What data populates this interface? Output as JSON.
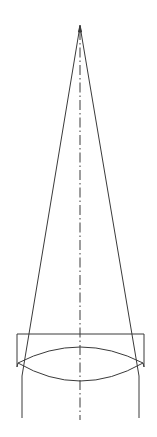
{
  "diagram": {
    "title": "",
    "type": "optical-lens-focus",
    "colors": {
      "line": "#3a3a3a",
      "background": "#ffffff"
    },
    "apex": {
      "x": 80,
      "y": 26
    },
    "axis": {
      "x": 80,
      "y1": 26,
      "y2": 420
    },
    "housing": {
      "x": 17,
      "y": 334,
      "width": 127,
      "height": 33
    },
    "lens": {
      "left": {
        "x": 18,
        "y": 363
      },
      "right": {
        "x": 143,
        "y": 363
      },
      "top_peak_y": 347,
      "bottom_peak_y": 381
    },
    "rays": [
      {
        "name": "left-ray",
        "x_at_lens": 22,
        "y_at_lens": 376,
        "y_end": 418
      },
      {
        "name": "right-ray",
        "x_at_lens": 139,
        "y_at_lens": 376,
        "y_end": 418
      }
    ]
  }
}
